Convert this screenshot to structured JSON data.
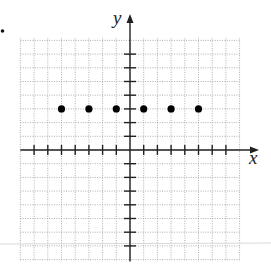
{
  "chart_data": {
    "type": "scatter",
    "title": "",
    "xlabel": "x",
    "ylabel": "y",
    "xlim": [
      -8,
      8
    ],
    "ylim": [
      -8,
      8
    ],
    "x_ticks": [
      -7,
      -6,
      -5,
      -4,
      -3,
      -2,
      -1,
      1,
      2,
      3,
      4,
      5,
      6,
      7
    ],
    "y_ticks": [
      -7,
      -6,
      -5,
      -4,
      -3,
      -2,
      -1,
      1,
      2,
      3,
      4,
      5,
      6,
      7
    ],
    "tick_labels_shown": false,
    "grid": true,
    "legend": "none",
    "points": [
      {
        "x": -5,
        "y": 3
      },
      {
        "x": -3,
        "y": 3
      },
      {
        "x": -1,
        "y": 3
      },
      {
        "x": 1,
        "y": 3
      },
      {
        "x": 3,
        "y": 3
      },
      {
        "x": 5,
        "y": 3
      }
    ]
  },
  "colors": {
    "axis": "#222222",
    "grid": "#9a9a9a",
    "point": "#000000",
    "artifact_line": "#d8d8d8"
  },
  "stray_bullet": "•"
}
